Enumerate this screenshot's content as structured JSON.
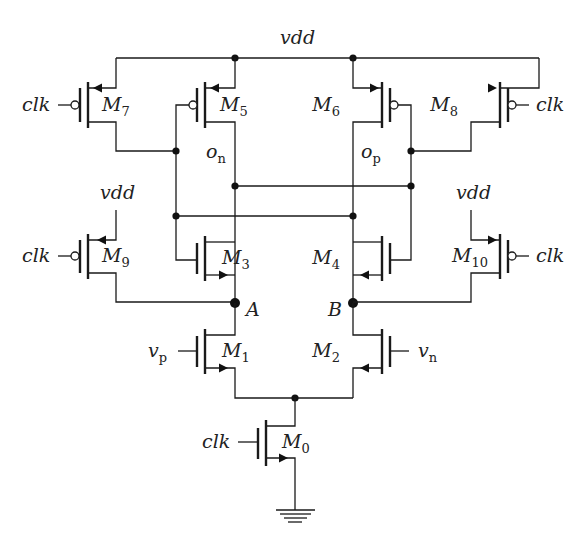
{
  "diagram": {
    "type": "circuit-schematic",
    "supply_label": "vdd",
    "ground": "gnd",
    "nodes": {
      "on": {
        "base": "o",
        "sub": "n"
      },
      "op": {
        "base": "o",
        "sub": "p"
      },
      "A": "A",
      "B": "B"
    },
    "inputs": {
      "vp": {
        "base": "v",
        "sub": "p"
      },
      "vn": {
        "base": "v",
        "sub": "n"
      },
      "clk": "clk"
    },
    "transistors": [
      {
        "id": "M0",
        "base": "M",
        "sub": "0",
        "type": "nmos",
        "gate": "clk"
      },
      {
        "id": "M1",
        "base": "M",
        "sub": "1",
        "type": "nmos",
        "gate": "vp"
      },
      {
        "id": "M2",
        "base": "M",
        "sub": "2",
        "type": "nmos",
        "gate": "vn"
      },
      {
        "id": "M3",
        "base": "M",
        "sub": "3",
        "type": "nmos",
        "gate": "op"
      },
      {
        "id": "M4",
        "base": "M",
        "sub": "4",
        "type": "nmos",
        "gate": "on"
      },
      {
        "id": "M5",
        "base": "M",
        "sub": "5",
        "type": "pmos",
        "gate": "op"
      },
      {
        "id": "M6",
        "base": "M",
        "sub": "6",
        "type": "pmos",
        "gate": "on"
      },
      {
        "id": "M7",
        "base": "M",
        "sub": "7",
        "type": "pmos",
        "gate": "clk"
      },
      {
        "id": "M8",
        "base": "M",
        "sub": "8",
        "type": "pmos",
        "gate": "clk"
      },
      {
        "id": "M9",
        "base": "M",
        "sub": "9",
        "type": "pmos",
        "gate": "clk"
      },
      {
        "id": "M10",
        "base": "M",
        "sub": "10",
        "type": "pmos",
        "gate": "clk"
      }
    ]
  }
}
